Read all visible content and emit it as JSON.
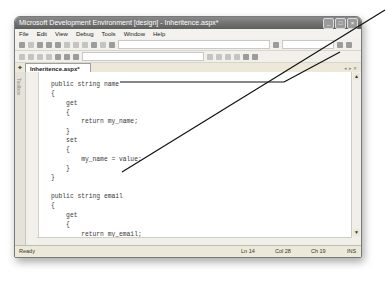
{
  "window": {
    "title": "Microsoft Development Environment [design] - Inheritence.aspx*",
    "controls": [
      "_",
      "□",
      "×"
    ]
  },
  "menubar": {
    "items": [
      "File",
      "Edit",
      "View",
      "Debug",
      "Tools",
      "Window",
      "Help"
    ]
  },
  "tabs": [
    {
      "label": "Inheritence.aspx*",
      "active": true
    }
  ],
  "toolbox": {
    "label": "Toolbox"
  },
  "editor": {
    "lines": [
      "public string name",
      "{",
      "    get",
      "    {",
      "        return my_name;",
      "    }",
      "    set",
      "    {",
      "        my_name = value;",
      "    }",
      "}",
      "",
      "public string email",
      "{",
      "    get",
      "    {",
      "        return my_email;",
      "    }",
      "    set",
      "    {",
      "        my_email = value;",
      "    }",
      "}",
      "",
      "public Employee()"
    ]
  },
  "statusbar": {
    "ready": "Ready",
    "line": "Ln 14",
    "col": "Col 28",
    "ch": "Ch 19",
    "mode": "INS"
  },
  "colors": {
    "titlebar": "#6e6e6e",
    "chrome": "#ece9d8",
    "callout_line": "#111111"
  }
}
